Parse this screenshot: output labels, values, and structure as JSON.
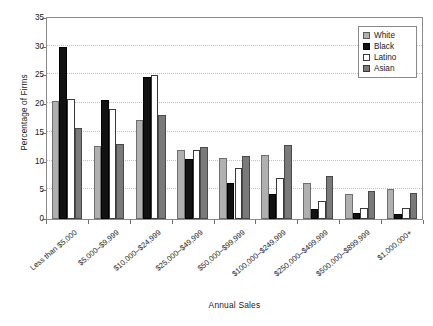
{
  "chart_data": {
    "type": "bar",
    "title": "",
    "xlabel": "Annual Sales",
    "ylabel": "Percentage of Firms",
    "ylim": [
      0,
      35
    ],
    "yticks": [
      0,
      5,
      10,
      15,
      20,
      25,
      30,
      35
    ],
    "grid": true,
    "legend_position": "top-right",
    "categories": [
      "Less than $5,000",
      "$5,000–$9,999",
      "$10,000–$24,999",
      "$25,000–$49,999",
      "$50,000–$99,999",
      "$100,000–$249,999",
      "$250,000–$499,999",
      "$500,000–$899,999",
      "$1,000,000+"
    ],
    "series": [
      {
        "name": "White",
        "color": "#b0b0b0",
        "values": [
          20.5,
          12.7,
          17.2,
          12.0,
          10.7,
          11.2,
          6.2,
          4.4,
          5.3
        ]
      },
      {
        "name": "Black",
        "color": "#121212",
        "values": [
          30.0,
          20.8,
          24.7,
          10.5,
          6.2,
          4.4,
          1.8,
          1.0,
          0.9
        ]
      },
      {
        "name": "Latino",
        "color": "#ffffff",
        "values": [
          20.9,
          19.2,
          25.0,
          12.0,
          8.8,
          7.2,
          3.2,
          2.0,
          1.9
        ]
      },
      {
        "name": "Asian",
        "color": "#7a7a7a",
        "values": [
          15.9,
          13.0,
          18.1,
          12.6,
          11.0,
          12.9,
          7.5,
          4.8,
          4.5
        ]
      }
    ]
  },
  "legend": {
    "items": [
      {
        "label": "White"
      },
      {
        "label": "Black"
      },
      {
        "label": "Latino"
      },
      {
        "label": "Asian"
      }
    ]
  }
}
